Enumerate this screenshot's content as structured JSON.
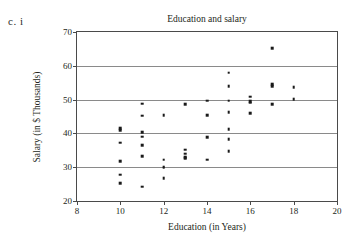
{
  "figure": {
    "label": "c.  i"
  },
  "chart_data": {
    "type": "scatter",
    "title": "Education and salary",
    "xlabel": "Education (in Years)",
    "ylabel": "Salary (in $ Thousands)",
    "xlim": [
      8,
      20
    ],
    "ylim": [
      20,
      70
    ],
    "xticks": [
      8,
      10,
      12,
      14,
      16,
      18,
      20
    ],
    "yticks": [
      20,
      30,
      40,
      50,
      60,
      70
    ],
    "xtick_labels": [
      "8",
      "10",
      "12",
      "14",
      "16",
      "18",
      "20"
    ],
    "ytick_labels": [
      "20",
      "30",
      "40",
      "50",
      "60",
      "70"
    ],
    "grid": "horizontal",
    "legend": null,
    "marker": "square",
    "marker_color": "#1a1a1a",
    "points": [
      {
        "x": 10,
        "y": 41.5
      },
      {
        "x": 10,
        "y": 41.0
      },
      {
        "x": 10,
        "y": 37.2
      },
      {
        "x": 10,
        "y": 31.7
      },
      {
        "x": 10,
        "y": 27.8
      },
      {
        "x": 10,
        "y": 25.2
      },
      {
        "x": 11,
        "y": 48.8
      },
      {
        "x": 11,
        "y": 45.2
      },
      {
        "x": 11,
        "y": 40.4
      },
      {
        "x": 11,
        "y": 39.0
      },
      {
        "x": 11,
        "y": 36.5
      },
      {
        "x": 11,
        "y": 33.3
      },
      {
        "x": 11,
        "y": 24.2
      },
      {
        "x": 12,
        "y": 45.3
      },
      {
        "x": 12,
        "y": 32.2
      },
      {
        "x": 12,
        "y": 30.2
      },
      {
        "x": 12,
        "y": 29.8
      },
      {
        "x": 12,
        "y": 26.8
      },
      {
        "x": 13,
        "y": 48.6
      },
      {
        "x": 13,
        "y": 35.2
      },
      {
        "x": 13,
        "y": 34.0
      },
      {
        "x": 13,
        "y": 33.0
      },
      {
        "x": 13,
        "y": 32.6
      },
      {
        "x": 14,
        "y": 49.7
      },
      {
        "x": 14,
        "y": 45.3
      },
      {
        "x": 14,
        "y": 38.9
      },
      {
        "x": 14,
        "y": 32.2
      },
      {
        "x": 15,
        "y": 58.0
      },
      {
        "x": 15,
        "y": 54.0
      },
      {
        "x": 15,
        "y": 49.7
      },
      {
        "x": 15,
        "y": 46.2
      },
      {
        "x": 15,
        "y": 41.3
      },
      {
        "x": 15,
        "y": 38.3
      },
      {
        "x": 15,
        "y": 34.7
      },
      {
        "x": 16,
        "y": 50.8
      },
      {
        "x": 16,
        "y": 49.6
      },
      {
        "x": 16,
        "y": 49.1
      },
      {
        "x": 16,
        "y": 46.0
      },
      {
        "x": 17,
        "y": 65.2
      },
      {
        "x": 17,
        "y": 54.6
      },
      {
        "x": 17,
        "y": 54.0
      },
      {
        "x": 17,
        "y": 48.7
      },
      {
        "x": 18,
        "y": 53.6
      },
      {
        "x": 18,
        "y": 50.2
      }
    ]
  }
}
